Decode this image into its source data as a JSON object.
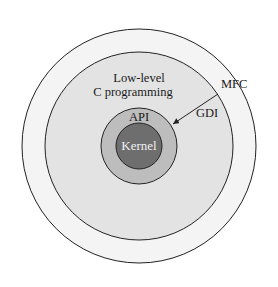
{
  "diagram": {
    "layers": [
      {
        "name": "outer",
        "label": "MFC",
        "fill": "#f4f4f4"
      },
      {
        "name": "middle",
        "label_line1": "Low-level",
        "label_line2": "C programming",
        "fill": "#e3e3e3"
      },
      {
        "name": "api",
        "label": "API",
        "fill": "#bdbdbd"
      },
      {
        "name": "kernel",
        "label": "Kernel",
        "fill": "#6e6e6e"
      }
    ],
    "arrow": {
      "label": "GDI"
    }
  }
}
